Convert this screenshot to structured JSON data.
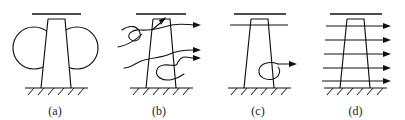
{
  "figure": {
    "background_color": "#ffffff",
    "line_color": "#111111",
    "panel_count": 4
  },
  "panels": [
    {
      "id": "panel-a",
      "caption": "(a)",
      "content_name": "pier-with-two-circles",
      "elements": {
        "deck_line": "horizontal deck line above pier",
        "pier": "tapered trapezoidal pier",
        "ground": "hatched ground line",
        "circle_count": 2,
        "circle_labels": [
          "left-circle",
          "right-circle"
        ]
      }
    },
    {
      "id": "panel-b",
      "caption": "(b)",
      "content_name": "pier-with-wavy-flow-lines",
      "elements": {
        "deck_line": "horizontal deck line above pier",
        "pier": "tapered trapezoidal pier",
        "ground": "hatched ground line",
        "flow_line_count": 3,
        "arrow_count": 4,
        "has_top_inner_arrow": "true"
      }
    },
    {
      "id": "panel-c",
      "caption": "(c)",
      "content_name": "pier-with-single-vortex",
      "elements": {
        "deck_line": "horizontal deck line above pier",
        "cap_line": "horizontal cap line crossing pier near top",
        "pier": "tapered trapezoidal pier",
        "ground": "hatched ground line",
        "vortex_count": 1,
        "arrow_count": 1
      }
    },
    {
      "id": "panel-d",
      "caption": "(d)",
      "content_name": "pier-with-uniform-arrow-load",
      "elements": {
        "deck_line": "horizontal deck line above pier",
        "pier": "tapered trapezoidal pier",
        "ground": "hatched ground line",
        "arrow_count": 5,
        "arrow_direction": "right"
      }
    }
  ]
}
